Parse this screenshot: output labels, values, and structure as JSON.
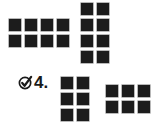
{
  "colors": {
    "square": "#1c1c1c",
    "text": "#1a1a1a",
    "background": "#ffffff"
  },
  "arrays": [
    {
      "id": "top-left",
      "rows": 2,
      "cols": 4,
      "x": 9,
      "y": 19
    },
    {
      "id": "top-right",
      "rows": 4,
      "cols": 2,
      "x": 81,
      "y": 3
    },
    {
      "id": "bottom-left",
      "rows": 3,
      "cols": 2,
      "x": 61,
      "y": 77
    },
    {
      "id": "bottom-right",
      "rows": 2,
      "cols": 3,
      "x": 106,
      "y": 85
    }
  ],
  "problem": {
    "icon": "check-circle-icon",
    "number": "4."
  }
}
